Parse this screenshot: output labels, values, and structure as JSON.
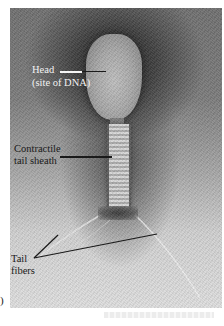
{
  "figure": {
    "panel_letter": ")",
    "labels": {
      "head_line1": "Head",
      "head_line2": "(site of DNA)",
      "sheath_line1": "Contractile",
      "sheath_line2": "tail sheath",
      "fibers_line1": "Tail",
      "fibers_line2": "fibers"
    },
    "colors": {
      "background_dark": "#3e3e3e",
      "background_light": "#dedede",
      "label_light": "#f2f2f2",
      "label_dark": "#1a1a1a"
    }
  }
}
